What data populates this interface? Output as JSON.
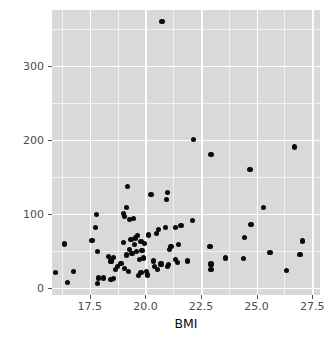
{
  "chart_data": {
    "type": "scatter",
    "title": "",
    "xlabel": "BMI",
    "ylabel": "Food_A",
    "xlim": [
      15.8,
      27.85
    ],
    "ylim": [
      -10,
      375
    ],
    "xticks": [
      17.5,
      20.0,
      22.5,
      25.0,
      27.5
    ],
    "xtick_labels": [
      "17.5",
      "20.0",
      "22.5",
      "25.0",
      "27.5"
    ],
    "yticks": [
      0,
      100,
      200,
      300
    ],
    "ytick_labels": [
      "0",
      "100",
      "200",
      "300"
    ],
    "grid": true,
    "grid_minor": true,
    "legend": "none",
    "panel_background": "#d9d9d9",
    "gridline_color": "#ffffff",
    "point_color": "#0a0a0a",
    "point_count": 83,
    "points": [
      [
        20.75,
        360
      ],
      [
        22.15,
        200
      ],
      [
        26.7,
        190
      ],
      [
        22.95,
        180
      ],
      [
        24.7,
        160
      ],
      [
        25.3,
        108
      ],
      [
        19.2,
        137
      ],
      [
        20.25,
        126
      ],
      [
        21.0,
        128
      ],
      [
        20.95,
        119
      ],
      [
        19.15,
        108
      ],
      [
        17.8,
        99
      ],
      [
        19.0,
        100
      ],
      [
        19.05,
        96
      ],
      [
        19.3,
        92
      ],
      [
        19.45,
        93
      ],
      [
        22.1,
        91
      ],
      [
        24.75,
        85
      ],
      [
        21.6,
        84
      ],
      [
        21.35,
        81
      ],
      [
        20.9,
        81
      ],
      [
        17.75,
        81
      ],
      [
        20.6,
        78
      ],
      [
        20.5,
        73
      ],
      [
        20.15,
        71
      ],
      [
        19.65,
        70
      ],
      [
        19.55,
        67
      ],
      [
        24.45,
        68
      ],
      [
        19.35,
        65
      ],
      [
        19.0,
        61
      ],
      [
        19.8,
        62
      ],
      [
        19.95,
        60
      ],
      [
        19.5,
        58
      ],
      [
        16.35,
        59
      ],
      [
        17.6,
        64
      ],
      [
        21.5,
        58
      ],
      [
        21.15,
        56
      ],
      [
        21.1,
        52
      ],
      [
        22.9,
        56
      ],
      [
        19.85,
        50
      ],
      [
        19.6,
        49
      ],
      [
        19.3,
        52
      ],
      [
        19.4,
        46
      ],
      [
        25.6,
        47
      ],
      [
        26.95,
        45
      ],
      [
        27.05,
        63
      ],
      [
        17.85,
        49
      ],
      [
        18.35,
        42
      ],
      [
        18.55,
        41
      ],
      [
        19.9,
        40
      ],
      [
        19.75,
        38
      ],
      [
        20.35,
        36
      ],
      [
        21.35,
        38
      ],
      [
        21.45,
        34
      ],
      [
        21.05,
        31
      ],
      [
        21.0,
        29
      ],
      [
        20.7,
        32
      ],
      [
        23.6,
        40
      ],
      [
        24.4,
        39
      ],
      [
        22.95,
        32
      ],
      [
        22.95,
        24
      ],
      [
        26.35,
        23
      ],
      [
        18.45,
        36
      ],
      [
        18.9,
        33
      ],
      [
        19.05,
        26
      ],
      [
        18.65,
        24
      ],
      [
        19.25,
        22
      ],
      [
        19.7,
        16
      ],
      [
        19.8,
        20
      ],
      [
        20.05,
        22
      ],
      [
        20.1,
        17
      ],
      [
        16.75,
        22
      ],
      [
        15.95,
        20
      ],
      [
        17.9,
        13
      ],
      [
        18.1,
        13
      ],
      [
        18.45,
        11
      ],
      [
        18.55,
        12
      ],
      [
        17.85,
        6
      ],
      [
        16.5,
        7
      ],
      [
        20.55,
        24
      ],
      [
        20.4,
        28
      ],
      [
        19.15,
        44
      ],
      [
        18.75,
        29
      ],
      [
        21.9,
        36
      ]
    ]
  },
  "axis": {
    "x_title": "BMI",
    "y_title": "Food_A"
  }
}
